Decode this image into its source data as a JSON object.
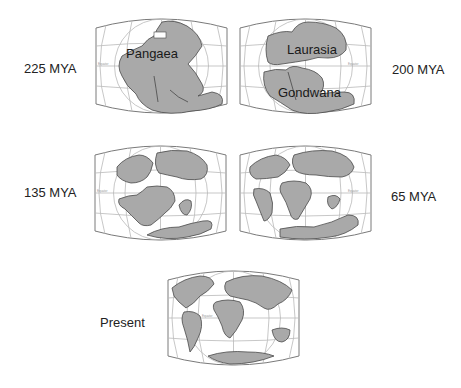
{
  "figure": {
    "type": "continental_drift_sequence",
    "panels": [
      {
        "era_label": "225 MYA",
        "landmass_labels": [
          "Pangaea"
        ],
        "equator_label": "Equator"
      },
      {
        "era_label": "200 MYA",
        "landmass_labels": [
          "Laurasia",
          "Gondwana"
        ],
        "equator_label": "Equator"
      },
      {
        "era_label": "135 MYA",
        "landmass_labels": [],
        "equator_label": "Equator"
      },
      {
        "era_label": "65 MYA",
        "landmass_labels": [],
        "equator_label": "Equator"
      },
      {
        "era_label": "Present",
        "landmass_labels": [],
        "equator_label": "Equator"
      }
    ]
  },
  "colors": {
    "land": "#a9a9a9",
    "outline": "#4a4a4a",
    "grid": "#b9b9b9",
    "background": "#ffffff"
  }
}
